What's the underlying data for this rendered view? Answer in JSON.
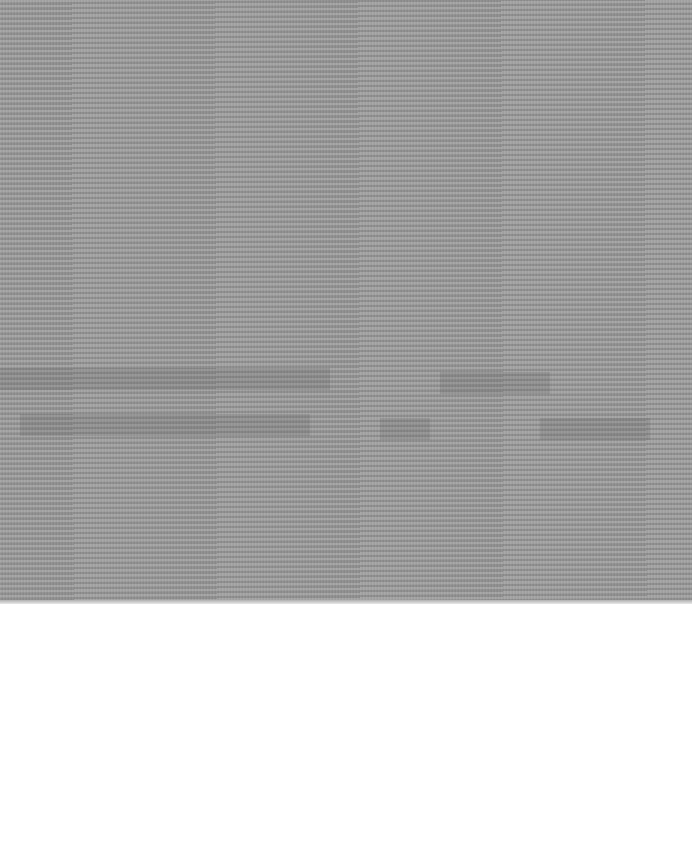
{
  "image": {
    "description": "Scanned gray moire-patterned surface on white paper",
    "colors": {
      "surface": "#9a9a9a",
      "paper": "#ffffff"
    },
    "surface_bottom_px": 603
  }
}
